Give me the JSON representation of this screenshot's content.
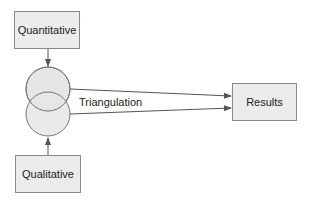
{
  "diagram": {
    "nodes": {
      "quantitative": "Quantitative",
      "qualitative": "Qualitative",
      "results": "Results"
    },
    "edge_label": "Triangulation",
    "colors": {
      "box_fill": "#ececec",
      "box_border": "#8a8a8a",
      "circle_fill": "#e6e6e6",
      "line": "#555555"
    }
  }
}
